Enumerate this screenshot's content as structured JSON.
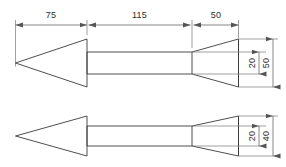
{
  "drawing": {
    "title": "Arrow profile dimensioned drawing",
    "units": "mm",
    "line_color": "#3a3a3a",
    "dimension_color": "#555555",
    "background": "#ffffff",
    "views": [
      {
        "name": "top-view",
        "description": "Arrow side profile with 50 tail height",
        "horizontal_dimensions": [
          {
            "label": "75",
            "segment": "head"
          },
          {
            "label": "115",
            "segment": "shaft"
          },
          {
            "label": "50",
            "segment": "tail"
          }
        ],
        "vertical_dimensions": [
          {
            "label": "20",
            "segment": "shaft-height"
          },
          {
            "label": "50",
            "segment": "tail-height"
          }
        ]
      },
      {
        "name": "bottom-view",
        "description": "Arrow side profile with 40 tail height",
        "horizontal_dimensions": [],
        "vertical_dimensions": [
          {
            "label": "20",
            "segment": "shaft-height"
          },
          {
            "label": "40",
            "segment": "tail-height"
          }
        ]
      }
    ],
    "dimension_labels": {
      "head_length": "75",
      "shaft_length": "115",
      "tail_length": "50",
      "shaft_height": "20",
      "top_tail_height": "50",
      "bottom_shaft_height": "20",
      "bottom_tail_height": "40"
    }
  }
}
